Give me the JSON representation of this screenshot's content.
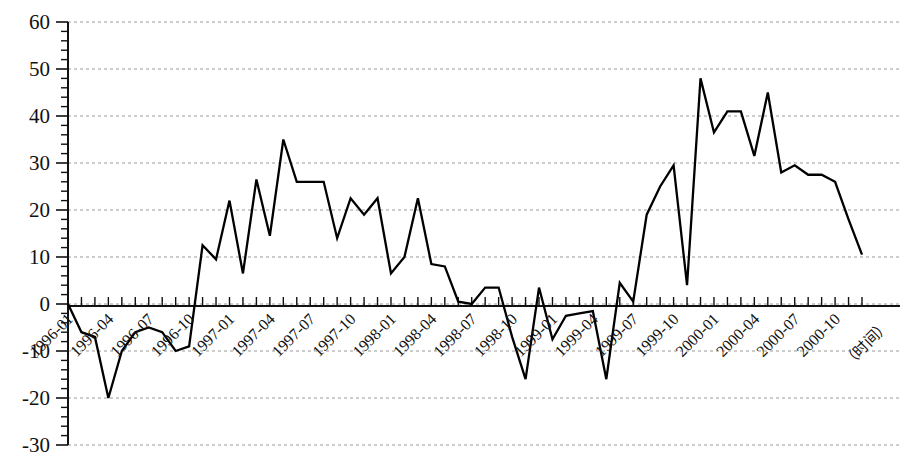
{
  "chart_data": {
    "type": "line",
    "title": "",
    "subtitle": "",
    "xlabel": "（时间）",
    "ylabel": "",
    "grid": true,
    "legend": false,
    "legend_position": "none",
    "ylim": [
      -30,
      60
    ],
    "ytick_step": 10,
    "yticks": [
      60,
      50,
      40,
      30,
      20,
      10,
      0,
      -10,
      -20,
      -30
    ],
    "ytick_labels": [
      "60",
      "50",
      "40",
      "30",
      "20",
      "10",
      "0",
      "-10",
      "-20",
      "-30"
    ],
    "y_minor_ticks_per_interval": 5,
    "xlabel_rotation_deg": -45,
    "xtick_labels": [
      "1996-01",
      "1996-04",
      "1996-07",
      "1996-10",
      "1997-01",
      "1997-04",
      "1997-07",
      "1997-10",
      "1998-01",
      "1998-04",
      "1998-07",
      "1998-10",
      "1999-01",
      "1999-04",
      "1999-07",
      "1999-10",
      "2000-01",
      "2000-04",
      "2000-07",
      "2000-10"
    ],
    "xtick_label_every_n_points": 3,
    "x": [
      "1996-01",
      "1996-02",
      "1996-03",
      "1996-04",
      "1996-05",
      "1996-06",
      "1996-07",
      "1996-08",
      "1996-09",
      "1996-10",
      "1996-11",
      "1996-12",
      "1997-01",
      "1997-02",
      "1997-03",
      "1997-04",
      "1997-05",
      "1997-06",
      "1997-07",
      "1997-08",
      "1997-09",
      "1997-10",
      "1997-11",
      "1997-12",
      "1998-01",
      "1998-02",
      "1998-03",
      "1998-04",
      "1998-05",
      "1998-06",
      "1998-07",
      "1998-08",
      "1998-09",
      "1998-10",
      "1998-11",
      "1998-12",
      "1999-01",
      "1999-02",
      "1999-03",
      "1999-04",
      "1999-05",
      "1999-06",
      "1999-07",
      "1999-08",
      "1999-09",
      "1999-10",
      "1999-11",
      "1999-12",
      "2000-01",
      "2000-02",
      "2000-03",
      "2000-04",
      "2000-05",
      "2000-06",
      "2000-07",
      "2000-08",
      "2000-09",
      "2000-10",
      "2000-11",
      "2000-12"
    ],
    "values": [
      0,
      -6,
      -7,
      -20,
      -10,
      -6,
      -5,
      -6,
      -10,
      -9,
      12.5,
      9.5,
      22,
      6.5,
      26.5,
      14.5,
      35,
      26,
      26,
      26,
      14,
      22.5,
      19,
      22.5,
      6.5,
      10,
      22.5,
      8.5,
      8,
      0.5,
      0,
      3.5,
      3.5,
      -7,
      -16,
      3.5,
      -7.5,
      -2.5,
      -2,
      -1.5,
      -16,
      4.5,
      0.5,
      19,
      25,
      29.5,
      4,
      48,
      36.5,
      41,
      41,
      31.5,
      45,
      28,
      29.5,
      27.5,
      27.5,
      26,
      18,
      10.5
    ],
    "series_name": "",
    "series_color": "#000000",
    "annotations": []
  },
  "axes": {
    "y_axis_name": "value-axis",
    "x_axis_name": "time-axis",
    "x_caption": "（时间）"
  }
}
